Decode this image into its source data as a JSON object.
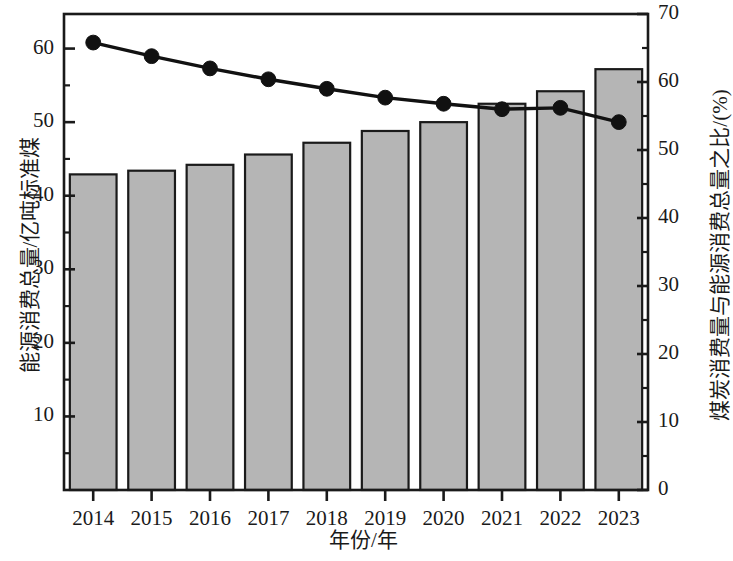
{
  "chart_data": {
    "type": "bar",
    "title": "",
    "xlabel": "年份/年",
    "categories": [
      "2014",
      "2015",
      "2016",
      "2017",
      "2018",
      "2019",
      "2020",
      "2021",
      "2022",
      "2023"
    ],
    "series": [
      {
        "name": "能源消费总量/亿吨标准煤",
        "type": "bar",
        "axis": "left",
        "values": [
          42.9,
          43.4,
          44.2,
          45.6,
          47.2,
          48.8,
          50.0,
          52.5,
          54.2,
          57.2
        ]
      },
      {
        "name": "煤炭消费量与能源消费总量之比/(%)",
        "type": "line",
        "axis": "right",
        "values": [
          65.8,
          63.8,
          62.0,
          60.4,
          59.0,
          57.7,
          56.8,
          56.0,
          56.2,
          54.1
        ]
      }
    ],
    "ylabel": "能源消费总量/亿吨标准煤",
    "ylabel_right": "煤炭消费量与能源消费总量之比/(%)",
    "ylim": [
      0.0,
      64.7
    ],
    "ylim_right": [
      0,
      70
    ],
    "yticks": [
      "10",
      "20",
      "30",
      "40",
      "50",
      "60"
    ],
    "ytick_values": [
      10,
      20,
      30,
      40,
      50,
      60
    ],
    "yticks_right": [
      "0",
      "10",
      "20",
      "30",
      "40",
      "50",
      "60",
      "70"
    ],
    "ytick_values_right": [
      0,
      10,
      20,
      30,
      40,
      50,
      60,
      70
    ],
    "grid": false,
    "legend": "none",
    "colors": {
      "bar_fill": "#b5b5b5",
      "bar_edge": "#1a1a1a",
      "line": "#111111",
      "marker": "#111111",
      "axis": "#1a1a1a",
      "text": "#1a1a1a"
    }
  }
}
